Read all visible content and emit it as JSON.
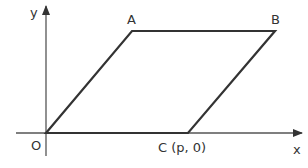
{
  "diagram": {
    "type": "parallelogram-on-axes",
    "axes": {
      "x_label": "x",
      "y_label": "y",
      "color": "#444444"
    },
    "points": {
      "O": {
        "label": "O"
      },
      "A": {
        "label": "A"
      },
      "B": {
        "label": "B"
      },
      "C": {
        "label": "C (p, 0)"
      }
    },
    "shape": {
      "name": "OABC",
      "vertices": [
        "O",
        "A",
        "B",
        "C"
      ],
      "stroke_color": "#333333"
    }
  }
}
